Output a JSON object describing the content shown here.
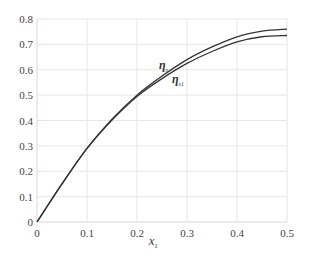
{
  "chart_data": {
    "type": "line",
    "title": "",
    "xlabel": "x1",
    "ylabel": "",
    "xlim": [
      0,
      0.5
    ],
    "ylim": [
      0,
      0.8
    ],
    "grid": true,
    "x_ticks": [
      "0",
      "0.1",
      "0.2",
      "0.3",
      "0.4",
      "0.5"
    ],
    "y_ticks": [
      "0",
      "0.1",
      "0.2",
      "0.3",
      "0.4",
      "0.5",
      "0.6",
      "0.7",
      "0.8"
    ],
    "x": [
      0,
      0.05,
      0.1,
      0.15,
      0.2,
      0.25,
      0.3,
      0.35,
      0.4,
      0.45,
      0.5
    ],
    "series": [
      {
        "name": "η_s",
        "label": "η",
        "sub": "s",
        "values": [
          0,
          0.15,
          0.29,
          0.405,
          0.5,
          0.575,
          0.64,
          0.69,
          0.73,
          0.752,
          0.76
        ]
      },
      {
        "name": "η_s1",
        "label": "η",
        "sub": "s1",
        "values": [
          0,
          0.15,
          0.29,
          0.402,
          0.495,
          0.565,
          0.625,
          0.672,
          0.71,
          0.73,
          0.735
        ]
      }
    ],
    "annotations": [
      {
        "text": "η_s",
        "x": 0.245,
        "y": 0.6
      },
      {
        "text": "η_s1",
        "x": 0.262,
        "y": 0.55
      }
    ],
    "legend": "inline annotations"
  },
  "labels": {
    "xlabel_main": "x",
    "xlabel_sub": "1",
    "eta": "η",
    "sub_s": "s",
    "sub_s1": "s1"
  }
}
